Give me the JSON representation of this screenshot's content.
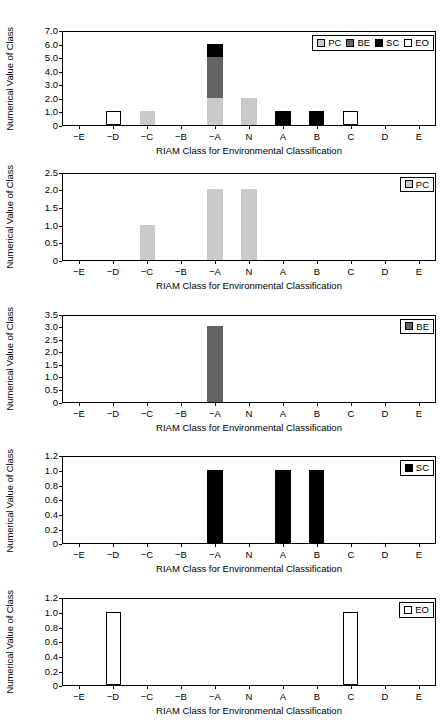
{
  "figure": {
    "axis_titles": {
      "y": "Numerical Value of Class",
      "x": "RIAM Class for Environmental Classification"
    },
    "categories": [
      "−E",
      "−D",
      "−C",
      "−B",
      "−A",
      "N",
      "A",
      "B",
      "C",
      "D",
      "E"
    ],
    "series_colors": {
      "PC": "#c9c9c9",
      "BE": "#636363",
      "SC": "#000000",
      "EO": "#ffffff"
    },
    "series_labels": {
      "PC": "PC",
      "BE": "BE",
      "SC": "SC",
      "EO": "EO"
    }
  },
  "chart_data": [
    {
      "type": "bar",
      "id": "panel-combined",
      "stacked": true,
      "title": "",
      "xlabel": "RIAM Class for Environmental Classification",
      "ylabel": "Numerical Value of Class",
      "categories": [
        "−E",
        "−D",
        "−C",
        "−B",
        "−A",
        "N",
        "A",
        "B",
        "C",
        "D",
        "E"
      ],
      "ylim": [
        0,
        7.0
      ],
      "yticks": [
        0,
        1.0,
        2.0,
        3.0,
        4.0,
        5.0,
        6.0,
        7.0
      ],
      "ytick_labels": [
        "0",
        "1.0",
        "2.0",
        "3.0",
        "4.0",
        "5.0",
        "6.0",
        "7.0"
      ],
      "grid": false,
      "legend": [
        "PC",
        "BE",
        "SC",
        "EO"
      ],
      "legend_position": "upper right",
      "series": [
        {
          "name": "PC",
          "color": "#c9c9c9",
          "values": [
            0,
            0,
            1,
            0,
            2,
            2,
            0,
            0,
            0,
            0,
            0
          ]
        },
        {
          "name": "BE",
          "color": "#636363",
          "values": [
            0,
            0,
            0,
            0,
            3,
            0,
            0,
            0,
            0,
            0,
            0
          ]
        },
        {
          "name": "SC",
          "color": "#000000",
          "values": [
            0,
            0,
            0,
            0,
            1,
            0,
            1,
            1,
            0,
            0,
            0
          ]
        },
        {
          "name": "EO",
          "color": "#ffffff",
          "values": [
            0,
            1,
            0,
            0,
            0,
            0,
            0,
            0,
            1,
            0,
            0
          ]
        }
      ]
    },
    {
      "type": "bar",
      "id": "panel-pc",
      "stacked": false,
      "title": "",
      "xlabel": "RIAM Class for Environmental Classification",
      "ylabel": "Numerical Value of Class",
      "categories": [
        "−E",
        "−D",
        "−C",
        "−B",
        "−A",
        "N",
        "A",
        "B",
        "C",
        "D",
        "E"
      ],
      "ylim": [
        0,
        2.5
      ],
      "yticks": [
        0,
        0.5,
        1.0,
        1.5,
        2.0,
        2.5
      ],
      "ytick_labels": [
        "0",
        "0.5",
        "1.0",
        "1.5",
        "2.0",
        "2.5"
      ],
      "grid": false,
      "legend": [
        "PC"
      ],
      "legend_position": "upper right",
      "series": [
        {
          "name": "PC",
          "color": "#c9c9c9",
          "values": [
            0,
            0,
            1.0,
            0,
            2.0,
            2.0,
            0,
            0,
            0,
            0,
            0
          ]
        }
      ]
    },
    {
      "type": "bar",
      "id": "panel-be",
      "stacked": false,
      "title": "",
      "xlabel": "RIAM Class for Environmental Classification",
      "ylabel": "Numerical Value of Class",
      "categories": [
        "−E",
        "−D",
        "−C",
        "−B",
        "−A",
        "N",
        "A",
        "B",
        "C",
        "D",
        "E"
      ],
      "ylim": [
        0,
        3.5
      ],
      "yticks": [
        0,
        0.5,
        1.0,
        1.5,
        2.0,
        2.5,
        3.0,
        3.5
      ],
      "ytick_labels": [
        "0",
        "0.5",
        "1.0",
        "1.5",
        "2.0",
        "2.5",
        "3.0",
        "3.5"
      ],
      "grid": false,
      "legend": [
        "BE"
      ],
      "legend_position": "upper right",
      "series": [
        {
          "name": "BE",
          "color": "#636363",
          "values": [
            0,
            0,
            0,
            0,
            3.0,
            0,
            0,
            0,
            0,
            0,
            0
          ]
        }
      ]
    },
    {
      "type": "bar",
      "id": "panel-sc",
      "stacked": false,
      "title": "",
      "xlabel": "RIAM Class for Environmental Classification",
      "ylabel": "Numerical Value of Class",
      "categories": [
        "−E",
        "−D",
        "−C",
        "−B",
        "−A",
        "N",
        "A",
        "B",
        "C",
        "D",
        "E"
      ],
      "ylim": [
        0,
        1.2
      ],
      "yticks": [
        0,
        0.2,
        0.4,
        0.6,
        0.8,
        1.0,
        1.2
      ],
      "ytick_labels": [
        "0",
        "0.2",
        "0.4",
        "0.6",
        "0.8",
        "1.0",
        "1.2"
      ],
      "grid": false,
      "legend": [
        "SC"
      ],
      "legend_position": "upper right",
      "series": [
        {
          "name": "SC",
          "color": "#000000",
          "values": [
            0,
            0,
            0,
            0,
            1.0,
            0,
            1.0,
            1.0,
            0,
            0,
            0
          ]
        }
      ]
    },
    {
      "type": "bar",
      "id": "panel-eo",
      "stacked": false,
      "title": "",
      "xlabel": "RIAM Class for Environmental Classification",
      "ylabel": "Numerical Value of Class",
      "categories": [
        "−E",
        "−D",
        "−C",
        "−B",
        "−A",
        "N",
        "A",
        "B",
        "C",
        "D",
        "E"
      ],
      "ylim": [
        0,
        1.2
      ],
      "yticks": [
        0,
        0.2,
        0.4,
        0.6,
        0.8,
        1.0,
        1.2
      ],
      "ytick_labels": [
        "0",
        "0.2",
        "0.4",
        "0.6",
        "0.8",
        "1.0",
        "1.2"
      ],
      "grid": false,
      "legend": [
        "EO"
      ],
      "legend_position": "upper right",
      "series": [
        {
          "name": "EO",
          "color": "#ffffff",
          "values": [
            0,
            1.0,
            0,
            0,
            0,
            0,
            0,
            0,
            1.0,
            0,
            0
          ]
        }
      ]
    }
  ]
}
